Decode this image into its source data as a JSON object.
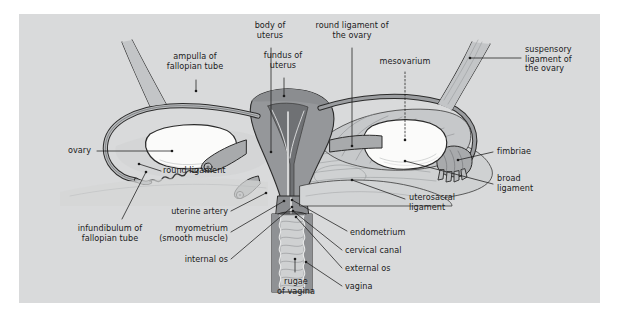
{
  "figure": {
    "panel_background": "#d9dadb",
    "page_background": "#ffffff",
    "text_color": "#1b1b1b"
  },
  "palette": {
    "outline": "#2b2b2b",
    "myometrium_dark": "#8f9194",
    "myometrium_mid": "#a6a8ab",
    "serosa_light": "#c3c5c7",
    "broad_ligament": "#cfd1d2",
    "ovary_white": "#fbfbfa",
    "vagina_lumen": "#c9cbcc",
    "tube_wall": "#9a9c9f"
  },
  "labels": [
    {
      "id": "ampulla-of-fallopian-tube",
      "text": "ampulla of\nfallopian tube",
      "x": 195,
      "y": 60,
      "align": "c"
    },
    {
      "id": "body-of-uterus",
      "text": "body of\nuterus",
      "x": 270,
      "y": 29,
      "align": "c"
    },
    {
      "id": "round-ligament-of-the-ovary",
      "text": "round ligament of\nthe ovary",
      "x": 352,
      "y": 29,
      "align": "c"
    },
    {
      "id": "fundus-of-uterus",
      "text": "fundus of\nuterus",
      "x": 283,
      "y": 59,
      "align": "c"
    },
    {
      "id": "mesovarium",
      "text": "mesovarium",
      "x": 405,
      "y": 62,
      "align": "c"
    },
    {
      "id": "suspensory-ligament-of-the-ovary",
      "text": "suspensory\nligament of\nthe ovary",
      "x": 525,
      "y": 48,
      "align": "l"
    },
    {
      "id": "ovary",
      "text": "ovary",
      "x": 68,
      "y": 147,
      "align": "l"
    },
    {
      "id": "round-ligament",
      "text": "round ligament",
      "x": 163,
      "y": 170,
      "align": "l"
    },
    {
      "id": "fimbriae",
      "text": "fimbriae",
      "x": 497,
      "y": 148,
      "align": "l"
    },
    {
      "id": "broad-ligament",
      "text": "broad\nligament",
      "x": 497,
      "y": 179,
      "align": "l"
    },
    {
      "id": "uterosacral-ligament",
      "text": "uterosacral\nligament",
      "x": 409,
      "y": 197,
      "align": "l"
    },
    {
      "id": "infundibulum-of-fallopian-tube",
      "text": "infundibulum of\nfallopian tube",
      "x": 110,
      "y": 225,
      "align": "c"
    },
    {
      "id": "uterine-artery",
      "text": "uterine artery",
      "x": 228,
      "y": 211,
      "align": "r"
    },
    {
      "id": "myometrium-smooth-muscle",
      "text": "myometrium\n(smooth muscle)",
      "x": 228,
      "y": 228,
      "align": "r"
    },
    {
      "id": "internal-os",
      "text": "internal os",
      "x": 228,
      "y": 258,
      "align": "r"
    },
    {
      "id": "endometrium",
      "text": "endometrium",
      "x": 350,
      "y": 233,
      "align": "l"
    },
    {
      "id": "cervical-canal",
      "text": "cervical canal",
      "x": 345,
      "y": 252,
      "align": "l"
    },
    {
      "id": "external-os",
      "text": "external os",
      "x": 345,
      "y": 270,
      "align": "l"
    },
    {
      "id": "vagina",
      "text": "vagina",
      "x": 345,
      "y": 288,
      "align": "l"
    },
    {
      "id": "rugae-of-vagina",
      "text": "rugae\nof vagina",
      "x": 296,
      "y": 280,
      "align": "c"
    }
  ],
  "leaders": [
    {
      "id": "leader-ampulla",
      "d": "M196,80 L196,91",
      "dot": [
        196,
        91
      ]
    },
    {
      "id": "leader-body-of-uterus",
      "d": "M271,48 L271,152",
      "dot": [
        271,
        152
      ]
    },
    {
      "id": "leader-round-ligament-of-ovary",
      "d": "M352,48 L352,146",
      "dot": [
        352,
        146
      ]
    },
    {
      "id": "leader-fundus",
      "d": "M284,78 L284,96",
      "dot": [
        284,
        96
      ]
    },
    {
      "id": "leader-mesovarium",
      "d": "M405,72 L405,140",
      "dot": [
        405,
        140
      ],
      "dashed": true
    },
    {
      "id": "leader-suspensory",
      "d": "M521,58 L470,58",
      "dot": [
        470,
        58
      ]
    },
    {
      "id": "leader-ovary",
      "d": "M97,151 L172,151",
      "dot": [
        172,
        151
      ]
    },
    {
      "id": "leader-round-ligament",
      "d": "M161,171 L139,164",
      "dot": [
        139,
        164
      ]
    },
    {
      "id": "leader-fimbriae",
      "d": "M493,152 L458,160",
      "dot": [
        458,
        160
      ]
    },
    {
      "id": "leader-broad-ligament",
      "d": "M493,184 L405,161",
      "dot": [
        405,
        161
      ]
    },
    {
      "id": "leader-uterosacral",
      "d": "M405,199 L352,180",
      "dot": [
        352,
        180
      ]
    },
    {
      "id": "leader-infundibulum",
      "d": "M122,219 L146,172",
      "dot": [
        146,
        172
      ]
    },
    {
      "id": "leader-uterine-artery",
      "d": "M231,211 L266,193",
      "dot": [
        266,
        193
      ]
    },
    {
      "id": "leader-myometrium",
      "d": "M231,232 L284,201",
      "dot": [
        284,
        201
      ]
    },
    {
      "id": "leader-internal-os",
      "d": "M231,259 L292,207",
      "dot": [
        292,
        207
      ]
    },
    {
      "id": "leader-endometrium",
      "d": "M347,231 L292,200",
      "dot": [
        292,
        200
      ]
    },
    {
      "id": "leader-cervical-canal",
      "d": "M342,250 L293,211",
      "dot": [
        293,
        211
      ]
    },
    {
      "id": "leader-external-os",
      "d": "M342,268 L296,217",
      "dot": [
        296,
        217
      ]
    },
    {
      "id": "leader-vagina",
      "d": "M342,286 L306,262",
      "dot": [
        306,
        262
      ]
    },
    {
      "id": "leader-rugae",
      "d": "M295,272 L295,259",
      "dot": [
        295,
        259
      ]
    }
  ]
}
